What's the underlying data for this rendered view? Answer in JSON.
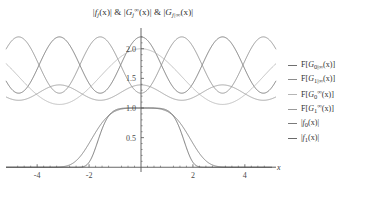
{
  "chart_data": {
    "type": "line",
    "title_parts": {
      "p1_f": "f",
      "p1_sub": "j",
      "p1_tail": "(x)|",
      "p2_G": "G",
      "p2_sub": "j",
      "p2_sup": "∞",
      "p2_tail": "(x)|",
      "p3_G": "G",
      "p3_sub": "j|∞",
      "p3_tail": "(x)|",
      "amp": "&"
    },
    "xlabel": "x",
    "ylabel": "",
    "xlim": [
      -5.2,
      5.2
    ],
    "ylim": [
      -0.08,
      2.35
    ],
    "xticks": [
      -4,
      -2,
      2,
      4
    ],
    "xtick_labels": [
      "-4",
      "-2",
      "2",
      "4"
    ],
    "yticks": [
      0.5,
      1.0,
      1.5,
      2.0
    ],
    "ytick_labels": [
      "0.5",
      "1.0",
      "1.5",
      "2.0"
    ],
    "grid": false,
    "legend_position": "right",
    "axis_color": "#555555",
    "series": [
      {
        "name": "F[G_{0|∞}(x)]",
        "label_G": "G",
        "label_sub": "0|∞",
        "color": "#6f6f6f",
        "kind": "cos_sq_shift",
        "params": {
          "base": 1.25,
          "amp": 0.95,
          "period": 3.14159,
          "phase": 0.0,
          "power": 2.0
        }
      },
      {
        "name": "F[G_{1|∞}(x)]",
        "label_G": "G",
        "label_sub": "1|∞",
        "color": "#8c8c8c",
        "kind": "cos_sq_shift",
        "params": {
          "base": 1.25,
          "amp": 0.95,
          "period": 3.14159,
          "phase": 1.5708,
          "power": 2.0
        }
      },
      {
        "name": "F[G_0^∞(x)]",
        "label_G": "G",
        "label_sub": "0",
        "label_sup": "∞",
        "color": "#b5b5b5",
        "kind": "cos_sq_shift",
        "params": {
          "base": 1.06,
          "amp": 0.94,
          "period": 6.28318,
          "phase": 0.0,
          "power": 2.0
        }
      },
      {
        "name": "F[G_1^∞(x)]",
        "label_G": "G",
        "label_sub": "1",
        "label_sup": "∞",
        "color": "#9a9a9a",
        "kind": "cos_sq_shift",
        "params": {
          "base": 1.13,
          "amp": 0.26,
          "period": 3.14159,
          "phase": 0.0,
          "power": 2.0
        }
      },
      {
        "name": "|f_0(x)|",
        "label_f": "f",
        "label_sub": "0",
        "color": "#7a7a7a",
        "kind": "supergauss",
        "params": {
          "amp": 1.0,
          "width": 2.05,
          "power": 4.0
        }
      },
      {
        "name": "|f_1(x)|",
        "label_f": "f",
        "label_sub": "1",
        "color": "#6a6a6a",
        "kind": "supergauss",
        "params": {
          "amp": 1.0,
          "width": 1.72,
          "power": 6.0
        }
      }
    ]
  },
  "legend": {
    "prefix_F": "F[",
    "suffix_F": "(x)]",
    "bar": "|",
    "suffix_abs": "(x)|",
    "items": [
      {
        "text": "F[G0|∞(x)]"
      },
      {
        "text": "F[G1|∞(x)]"
      },
      {
        "text": "F[G0∞(x)]"
      },
      {
        "text": "F[G1∞(x)]"
      },
      {
        "text": "|f0(x)|"
      },
      {
        "text": "|f1(x)|"
      }
    ]
  }
}
